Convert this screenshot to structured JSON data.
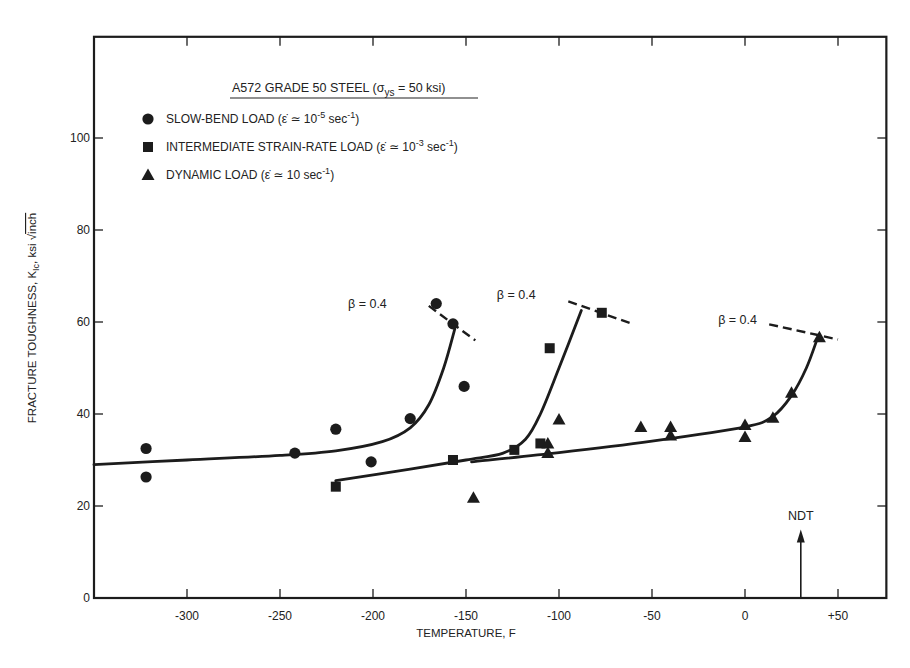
{
  "chart_data": {
    "type": "scatter",
    "title": "A572 GRADE 50 STEEL (σys = 50 ksi)",
    "title_parts": {
      "main": "A572 GRADE 50 STEEL (σ",
      "sub": "ys",
      "tail": " = 50 ksi)"
    },
    "xlabel": "TEMPERATURE, F",
    "ylabel": "FRACTURE TOUGHNESS, KIc, ksi √inch",
    "ylabel_parts": {
      "main": "FRACTURE TOUGHNESS, K",
      "sub": "Ic",
      "mid": ", ksi ",
      "sqrt": "inch"
    },
    "xlim": [
      -350,
      76
    ],
    "ylim": [
      0,
      122
    ],
    "x_ticks": [
      -300,
      -250,
      -200,
      -150,
      -100,
      -50,
      0,
      50
    ],
    "x_tick_labels": [
      "-300",
      "-250",
      "-200",
      "-150",
      "-100",
      "-50",
      "0",
      "+50"
    ],
    "y_ticks": [
      0,
      20,
      40,
      60,
      80,
      100
    ],
    "y_tick_labels": [
      "0",
      "20",
      "40",
      "60",
      "80",
      "100"
    ],
    "grid": false,
    "legend_position": "upper-left",
    "legend": [
      {
        "marker": "circle",
        "label": "SLOW-BEND LOAD (ε̇ ≃ 10⁻⁵ sec⁻¹)",
        "text": "SLOW-BEND LOAD",
        "rate": "(ε̇ ≃ 10",
        "exp": "-5",
        "unit": " sec",
        "uexp": "-1",
        "close": ")"
      },
      {
        "marker": "square",
        "label": "INTERMEDIATE STRAIN-RATE LOAD (ε̇ ≃ 10⁻³ sec⁻¹)",
        "text": "INTERMEDIATE STRAIN-RATE LOAD",
        "rate": "(ε̇ ≃ 10",
        "exp": "-3",
        "unit": " sec",
        "uexp": "-1",
        "close": ")"
      },
      {
        "marker": "triangle",
        "label": "DYNAMIC LOAD (ε̇ ≃ 10 sec⁻¹)",
        "text": "DYNAMIC LOAD",
        "rate": "(ε̇ ≃ 10",
        "exp": "",
        "unit": " sec",
        "uexp": "-1",
        "close": ")"
      }
    ],
    "series": [
      {
        "name": "Slow-bend load",
        "marker": "circle",
        "points": [
          [
            -322,
            32.5
          ],
          [
            -322,
            26.3
          ],
          [
            -242,
            31.5
          ],
          [
            -220,
            36.7
          ],
          [
            -201,
            29.6
          ],
          [
            -180,
            39.0
          ],
          [
            -166,
            64.0
          ],
          [
            -157,
            59.6
          ],
          [
            -151,
            46.0
          ]
        ],
        "curve": [
          [
            -350,
            29.0
          ],
          [
            -300,
            30.0
          ],
          [
            -250,
            31.0
          ],
          [
            -220,
            32.0
          ],
          [
            -195,
            34.0
          ],
          [
            -180,
            37.0
          ],
          [
            -170,
            42.0
          ],
          [
            -162,
            50.0
          ],
          [
            -156,
            58.5
          ]
        ],
        "beta_line": [
          [
            -170,
            63.5
          ],
          [
            -145,
            56.0
          ]
        ]
      },
      {
        "name": "Intermediate strain-rate load",
        "marker": "square",
        "points": [
          [
            -220,
            24.2
          ],
          [
            -157,
            30.0
          ],
          [
            -124,
            32.2
          ],
          [
            -110,
            33.6
          ],
          [
            -105,
            54.3
          ],
          [
            -77,
            62.0
          ]
        ],
        "curve": [
          [
            -220,
            25.5
          ],
          [
            -180,
            28.0
          ],
          [
            -150,
            30.0
          ],
          [
            -130,
            31.5
          ],
          [
            -118,
            34.5
          ],
          [
            -110,
            40.0
          ],
          [
            -100,
            50.0
          ],
          [
            -88,
            62.5
          ]
        ],
        "beta_line": [
          [
            -95,
            64.5
          ],
          [
            -60,
            59.5
          ]
        ]
      },
      {
        "name": "Dynamic load",
        "marker": "triangle",
        "points": [
          [
            -146,
            21.8
          ],
          [
            -106,
            33.6
          ],
          [
            -106,
            31.5
          ],
          [
            -100,
            38.8
          ],
          [
            -56,
            37.2
          ],
          [
            -40,
            37.2
          ],
          [
            -40,
            35.3
          ],
          [
            0,
            37.6
          ],
          [
            0,
            35.0
          ],
          [
            15,
            39.2
          ],
          [
            25,
            44.6
          ],
          [
            40,
            56.7
          ]
        ],
        "curve": [
          [
            -147,
            29.6
          ],
          [
            -100,
            31.6
          ],
          [
            -50,
            34.1
          ],
          [
            0,
            37.2
          ],
          [
            15,
            39.5
          ],
          [
            25,
            44.0
          ],
          [
            33,
            50.0
          ],
          [
            39,
            56.5
          ]
        ],
        "beta_line": [
          [
            13,
            59.5
          ],
          [
            50,
            56.2
          ]
        ]
      }
    ],
    "annotations": [
      {
        "text": "β = 0.4",
        "x": -203,
        "y": 63.0
      },
      {
        "text": "β = 0.4",
        "x": -123,
        "y": 65.0
      },
      {
        "text": "β = 0.4",
        "x": -4,
        "y": 59.5
      },
      {
        "text": "NDT",
        "x": 30,
        "y": 17,
        "arrow_to": [
          30,
          0
        ],
        "arrow_from": [
          30,
          14
        ]
      }
    ]
  }
}
